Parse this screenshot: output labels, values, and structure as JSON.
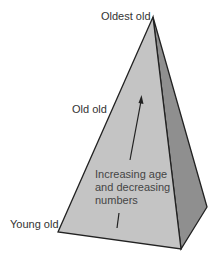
{
  "diagram": {
    "type": "pyramid",
    "labels": {
      "top": "Oldest old",
      "middle": "Old old",
      "bottom": "Young old"
    },
    "arrow_caption": [
      "Increasing age",
      "and decreasing",
      "numbers"
    ],
    "colors": {
      "front_face": "#c4c4c4",
      "side_face": "#8f8f8f",
      "edge": "#222222",
      "text": "#333333"
    }
  }
}
